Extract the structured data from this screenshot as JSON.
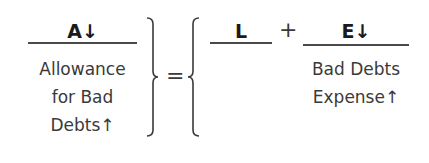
{
  "equation": {
    "asset": {
      "heading": "A↓",
      "label_lines": [
        "Allowance",
        "for Bad",
        "Debts↑"
      ]
    },
    "equals": "=",
    "liability": {
      "heading": "L"
    },
    "plus": "+",
    "equity": {
      "heading": "E↓",
      "label_lines": [
        "Bad Debts",
        "Expense↑"
      ]
    }
  }
}
